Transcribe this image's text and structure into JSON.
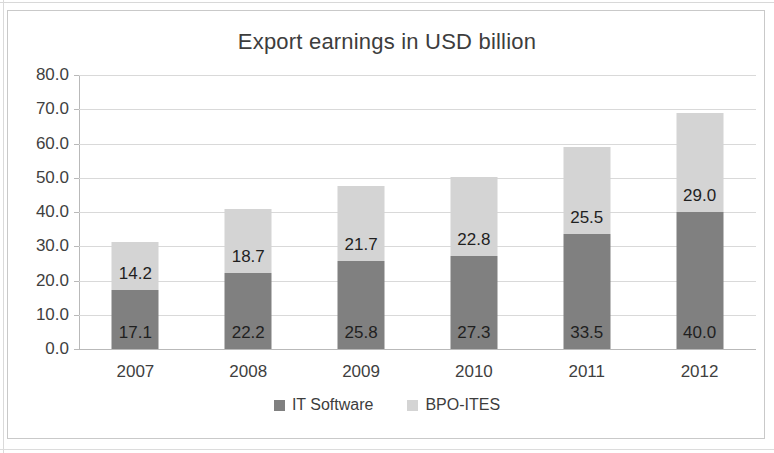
{
  "chart_data": {
    "type": "bar",
    "subtype": "stacked-column",
    "title": "Export earnings in USD billion",
    "xlabel": "",
    "ylabel": "",
    "categories": [
      "2007",
      "2008",
      "2009",
      "2010",
      "2011",
      "2012"
    ],
    "series": [
      {
        "name": "IT Software",
        "color": "#808080",
        "values": [
          17.1,
          22.2,
          25.8,
          27.3,
          33.5,
          40.0
        ],
        "labels": [
          "17.1",
          "22.2",
          "25.8",
          "27.3",
          "33.5",
          "40.0"
        ]
      },
      {
        "name": "BPO-ITES",
        "color": "#d4d4d4",
        "values": [
          14.2,
          18.7,
          21.7,
          22.8,
          25.5,
          29.0
        ],
        "labels": [
          "14.2",
          "18.7",
          "21.7",
          "22.8",
          "25.5",
          "29.0"
        ]
      }
    ],
    "totals": [
      31.3,
      40.9,
      47.5,
      50.1,
      59.0,
      69.0
    ],
    "ylim": [
      0,
      80
    ],
    "ytick_step": 10,
    "ytick_labels": [
      "80.0",
      "70.0",
      "60.0",
      "50.0",
      "40.0",
      "30.0",
      "20.0",
      "10.0",
      "0.0"
    ],
    "ytick_values": [
      80,
      70,
      60,
      50,
      40,
      30,
      20,
      10,
      0
    ],
    "grid": true,
    "grid_axis": "y",
    "legend_position": "bottom",
    "data_labels": true
  },
  "legend": {
    "items": [
      {
        "label": "IT Software",
        "marker": "square-marker-dark"
      },
      {
        "label": "BPO-ITES",
        "marker": "square-marker-light"
      }
    ]
  }
}
